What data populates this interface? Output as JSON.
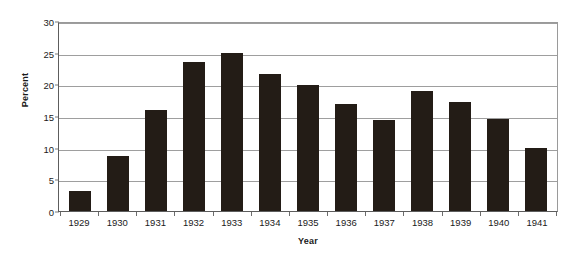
{
  "chart_data": {
    "type": "bar",
    "title": "",
    "xlabel": "Year",
    "ylabel": "Percent",
    "categories": [
      "1929",
      "1930",
      "1931",
      "1932",
      "1933",
      "1934",
      "1935",
      "1936",
      "1937",
      "1938",
      "1939",
      "1940",
      "1941"
    ],
    "values": [
      3.2,
      8.7,
      15.9,
      23.6,
      24.9,
      21.7,
      19.9,
      16.9,
      14.3,
      19.0,
      17.2,
      14.6,
      9.9
    ],
    "ylim": [
      0,
      30
    ],
    "ytick_labels": [
      "0",
      "5",
      "10",
      "15",
      "20",
      "25",
      "30"
    ],
    "ytick_values": [
      0,
      5,
      10,
      15,
      20,
      25,
      30
    ],
    "grid": true,
    "legend": false,
    "bar_color": "#231c16",
    "grid_color": "#9e9e9e",
    "axis_color": "#5d5d5d",
    "background": "#ffffff"
  }
}
